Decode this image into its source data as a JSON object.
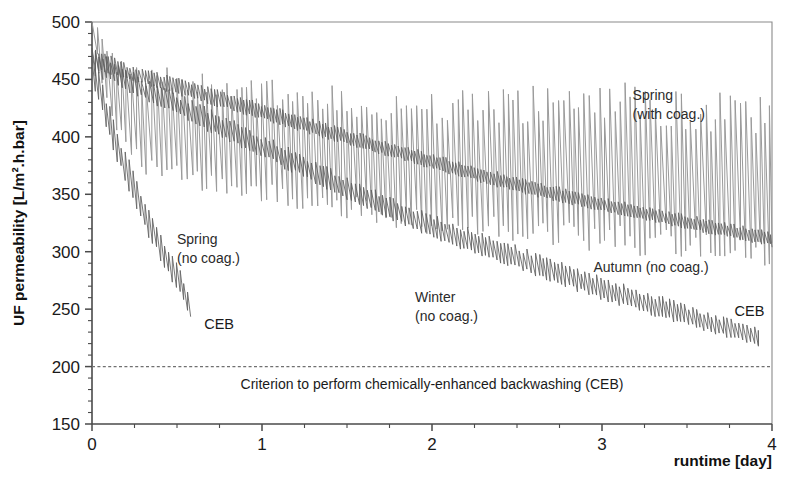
{
  "chart_data": {
    "type": "line",
    "title": "",
    "xlabel": "runtime [day]",
    "ylabel": "UF permeability [L/m².h.bar]",
    "xlim": [
      0,
      4
    ],
    "ylim": [
      150,
      500
    ],
    "x_ticks": [
      "0",
      "1",
      "2",
      "3",
      "4"
    ],
    "x_tick_values": [
      0,
      1,
      2,
      3,
      4
    ],
    "x_minor_step": 0.25,
    "y_ticks": [
      "150",
      "200",
      "250",
      "300",
      "350",
      "400",
      "450",
      "500"
    ],
    "y_tick_values": [
      150,
      200,
      250,
      300,
      350,
      400,
      450,
      500
    ],
    "y_minor_step": 10,
    "grid": false,
    "legend": "inline-annotations",
    "reference_lines": [
      {
        "name": "ceb-criterion",
        "value": 200,
        "style": "dashed",
        "color": "#707070",
        "label": "Criterion to perform chemically-enhanced backwashing (CEB)"
      }
    ],
    "series": [
      {
        "name": "Spring (with coag.)",
        "label": "Spring\n(with coag.)",
        "color": "#9a9a9a",
        "oscillation": "sawtooth-large",
        "x_start": 0.0,
        "x_end": 4.0,
        "baseline_x": [
          0.0,
          0.1,
          0.3,
          0.6,
          1.0,
          1.5,
          2.0,
          2.5,
          3.0,
          3.5,
          4.0
        ],
        "baseline_y": [
          470,
          410,
          372,
          362,
          352,
          338,
          325,
          318,
          310,
          305,
          300
        ],
        "peak_x": [
          0.0,
          0.1,
          0.3,
          0.6,
          1.0,
          1.5,
          2.0,
          2.5,
          3.0,
          3.5,
          4.0
        ],
        "peak_y": [
          500,
          470,
          452,
          448,
          440,
          432,
          425,
          428,
          432,
          424,
          418
        ]
      },
      {
        "name": "Autumn (no coag.)",
        "label": "Autumn (no coag.)",
        "color": "#5e5e5e",
        "oscillation": "sawtooth-small",
        "x_start": 0.0,
        "x_end": 4.0,
        "baseline_x": [
          0.0,
          0.2,
          0.5,
          1.0,
          1.5,
          2.0,
          2.5,
          3.0,
          3.5,
          4.0
        ],
        "baseline_y": [
          460,
          450,
          437,
          415,
          393,
          372,
          352,
          335,
          320,
          305
        ],
        "peak_x": [
          0.0,
          0.2,
          0.5,
          1.0,
          1.5,
          2.0,
          2.5,
          3.0,
          3.5,
          4.0
        ],
        "peak_y": [
          478,
          462,
          450,
          428,
          405,
          384,
          364,
          346,
          331,
          316
        ]
      },
      {
        "name": "Winter (no coag.)",
        "label": "Winter\n(no coag.)",
        "color": "#5e5e5e",
        "oscillation": "sawtooth-medium",
        "x_start": 0.0,
        "x_end": 3.92,
        "baseline_x": [
          0.0,
          0.2,
          0.5,
          1.0,
          1.5,
          2.0,
          2.5,
          3.0,
          3.5,
          3.92
        ],
        "baseline_y": [
          455,
          440,
          418,
          382,
          345,
          312,
          285,
          258,
          236,
          218
        ],
        "peak_x": [
          0.0,
          0.2,
          0.5,
          1.0,
          1.5,
          2.0,
          2.5,
          3.0,
          3.5,
          3.92
        ],
        "peak_y": [
          475,
          458,
          436,
          400,
          363,
          330,
          303,
          276,
          252,
          232
        ]
      },
      {
        "name": "Spring (no coag.)",
        "label": "Spring\n(no coag.)",
        "color": "#5e5e5e",
        "oscillation": "sawtooth-medium",
        "x_start": 0.0,
        "x_end": 0.58,
        "baseline_x": [
          0.0,
          0.1,
          0.2,
          0.3,
          0.4,
          0.5,
          0.58
        ],
        "baseline_y": [
          440,
          392,
          350,
          318,
          288,
          262,
          240
        ],
        "peak_x": [
          0.0,
          0.1,
          0.2,
          0.3,
          0.4,
          0.5,
          0.58
        ],
        "peak_y": [
          470,
          425,
          382,
          348,
          315,
          288,
          256
        ]
      }
    ],
    "annotations": [
      {
        "name": "spring-with-coag-label",
        "text_line1": "Spring",
        "text_line2": "(with coag.)",
        "x": 3.18,
        "y": 432
      },
      {
        "name": "spring-no-coag-label",
        "text_line1": "Spring",
        "text_line2": "(no coag.)",
        "x": 0.5,
        "y": 307
      },
      {
        "name": "winter-no-coag-label",
        "text_line1": "Winter",
        "text_line2": "(no coag.)",
        "x": 1.9,
        "y": 256
      },
      {
        "name": "autumn-no-coag-label",
        "text_line1": "Autumn (no coag.)",
        "text_line2": "",
        "x": 2.95,
        "y": 282
      },
      {
        "name": "ceb-label-left",
        "text_line1": "CEB",
        "text_line2": "",
        "x": 0.66,
        "y": 233
      },
      {
        "name": "ceb-label-right",
        "text_line1": "CEB",
        "text_line2": "",
        "x": 3.78,
        "y": 244
      }
    ]
  }
}
